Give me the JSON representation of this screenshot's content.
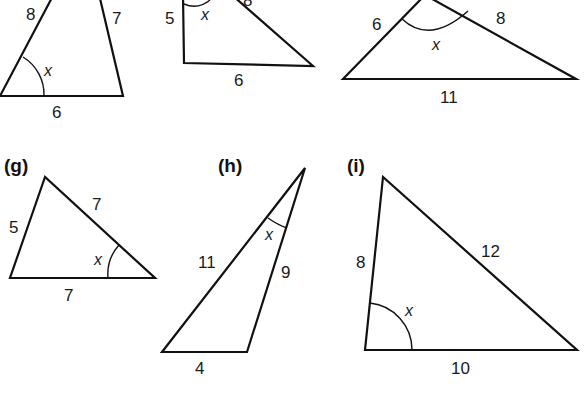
{
  "figure": {
    "angle_variable": "x",
    "triangles": [
      {
        "id": "d",
        "tag": "",
        "sides": {
          "left": "8",
          "right": "7",
          "bottom": "6"
        },
        "angle": "x"
      },
      {
        "id": "e",
        "tag": "",
        "sides": {
          "left": "5",
          "bottom": "6",
          "top": "8"
        },
        "angle": "x"
      },
      {
        "id": "f",
        "tag": "",
        "sides": {
          "left": "6",
          "right": "8",
          "bottom": "11"
        },
        "angle": "x"
      },
      {
        "id": "g",
        "tag": "(g)",
        "sides": {
          "left": "5",
          "right": "7",
          "bottom": "7"
        },
        "angle": "x"
      },
      {
        "id": "h",
        "tag": "(h)",
        "sides": {
          "left": "11",
          "right": "9",
          "bottom": "4"
        },
        "angle": "x"
      },
      {
        "id": "i",
        "tag": "(i)",
        "sides": {
          "left": "8",
          "right": "12",
          "bottom": "10"
        },
        "angle": "x"
      }
    ]
  }
}
